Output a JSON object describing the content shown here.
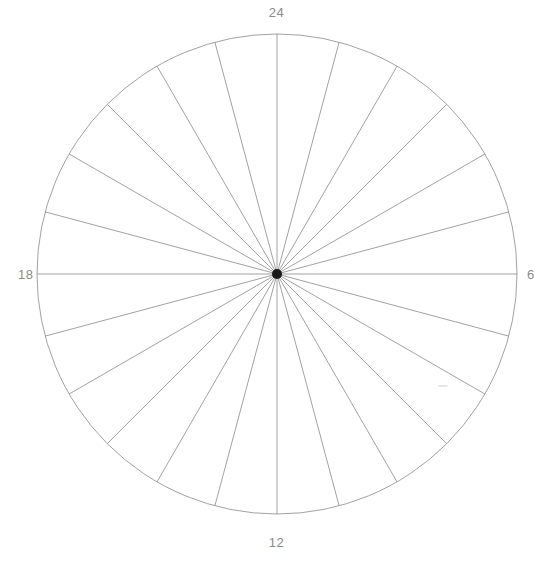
{
  "figure": {
    "kind": "polar-sector-diagram",
    "background_color": "#ffffff",
    "width": 553,
    "height": 562
  },
  "axis_labels": {
    "top": "24",
    "right": "6",
    "bottom": "12",
    "left": "18"
  },
  "style": {
    "line_color": "#8a8a8a",
    "line_width": 0.8,
    "circle_color": "#8a8a8a",
    "hub_color": "#1a1a1a",
    "label_color": "#8a8a8a",
    "artifact_color": "#c8c8c8"
  },
  "geometry": {
    "center_x": 277,
    "center_y": 274,
    "radius": 240,
    "hub_radius": 5,
    "sector_count": 24,
    "sector_degrees": 15,
    "spoke_count": 24
  },
  "chart_data": {
    "type": "pie",
    "title": "",
    "subtitle": "",
    "xlabel": "",
    "ylabel": "",
    "legend_position": "none",
    "grid": false,
    "polar": true,
    "clockwise": true,
    "zero_at": "top",
    "axis_tick_labels": [
      "24",
      "6",
      "12",
      "18"
    ],
    "axis_tick_angles_deg": [
      0,
      90,
      180,
      270
    ],
    "radial_axis_range": [
      0,
      240
    ],
    "annotations": [
      {
        "name": "faint-dash-artifact",
        "x": 443,
        "y": 386,
        "width": 9,
        "height": 1,
        "text": ""
      }
    ],
    "categories": [
      "0-1",
      "1-2",
      "2-3",
      "3-4",
      "4-5",
      "5-6",
      "6-7",
      "7-8",
      "8-9",
      "9-10",
      "10-11",
      "11-12",
      "12-13",
      "13-14",
      "14-15",
      "15-16",
      "16-17",
      "17-18",
      "18-19",
      "19-20",
      "20-21",
      "21-22",
      "22-23",
      "23-24"
    ],
    "values": [
      0,
      0,
      0,
      0,
      0,
      0,
      0,
      0,
      0,
      0,
      0,
      0,
      0,
      0,
      0,
      0,
      0,
      0,
      0,
      0,
      0,
      0,
      0,
      0
    ],
    "sector_boundary_angles_deg": [
      0,
      15,
      30,
      45,
      60,
      75,
      90,
      105,
      120,
      135,
      150,
      165,
      180,
      195,
      210,
      225,
      240,
      255,
      270,
      285,
      300,
      315,
      330,
      345
    ]
  }
}
